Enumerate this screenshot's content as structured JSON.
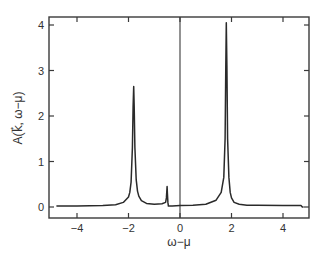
{
  "chart_data": {
    "type": "line",
    "title": "",
    "xlabel": "ω−μ",
    "ylabel": "A(k⃗, ω−μ)",
    "xlim": [
      -5,
      5
    ],
    "ylim": [
      -0.2,
      4.2
    ],
    "xticks": [
      -4,
      -2,
      0,
      2,
      4
    ],
    "xtick_labels": [
      "−4",
      "−2",
      "0",
      "2",
      "4"
    ],
    "yticks": [
      0,
      1,
      2,
      3,
      4
    ],
    "ytick_labels": [
      "0",
      "1",
      "2",
      "3",
      "4"
    ],
    "grid": false,
    "legend": null,
    "annotations": [
      {
        "type": "vline",
        "x": 0,
        "label": ""
      }
    ],
    "peaks": [
      {
        "x": -1.8,
        "height": 2.65,
        "label": "lower quasiparticle peak"
      },
      {
        "x": -0.5,
        "height": 0.45,
        "label": "small peak"
      },
      {
        "x": 1.8,
        "height": 4.05,
        "label": "upper quasiparticle peak"
      }
    ],
    "series": [
      {
        "name": "A(k, ω−μ)",
        "x": [
          -4.8,
          -4.0,
          -3.0,
          -2.5,
          -2.2,
          -2.0,
          -1.95,
          -1.9,
          -1.85,
          -1.82,
          -1.8,
          -1.78,
          -1.75,
          -1.7,
          -1.65,
          -1.6,
          -1.5,
          -1.3,
          -1.0,
          -0.7,
          -0.56,
          -0.53,
          -0.51,
          -0.5,
          -0.49,
          -0.47,
          -0.45,
          -0.3,
          0.0,
          0.5,
          1.0,
          1.4,
          1.6,
          1.7,
          1.75,
          1.78,
          1.8,
          1.82,
          1.85,
          1.9,
          1.95,
          2.0,
          2.1,
          2.3,
          2.6,
          3.0,
          4.0,
          4.7,
          4.75,
          4.8
        ],
        "y": [
          0.02,
          0.02,
          0.03,
          0.05,
          0.1,
          0.22,
          0.32,
          0.55,
          1.3,
          2.2,
          2.65,
          2.2,
          1.3,
          0.6,
          0.35,
          0.24,
          0.14,
          0.08,
          0.06,
          0.07,
          0.1,
          0.2,
          0.38,
          0.45,
          0.3,
          0.1,
          0.02,
          0.02,
          0.03,
          0.04,
          0.06,
          0.15,
          0.32,
          0.65,
          1.5,
          3.1,
          4.05,
          3.1,
          1.5,
          0.65,
          0.32,
          0.2,
          0.1,
          0.06,
          0.04,
          0.04,
          0.03,
          0.03,
          0.0,
          0.0
        ]
      }
    ]
  }
}
